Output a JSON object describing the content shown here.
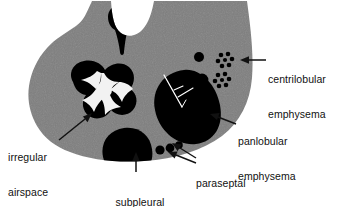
{
  "figure": {
    "type": "medical-illustration",
    "background_color": "#ffffff",
    "lung_fill_color": "#808080",
    "lesion_color": "#000000",
    "text_color": "#111111",
    "width": 344,
    "height": 207
  },
  "labels": {
    "centrilobular": {
      "name": "centrilobular-emphysema-label",
      "lines": [
        "centrilobular",
        "emphysema"
      ],
      "arrow": "points-left"
    },
    "panlobular": {
      "name": "panlobular-emphysema-label",
      "lines": [
        "panlobular",
        "emphysema"
      ],
      "arrow": "points-left"
    },
    "paraseptal": {
      "name": "paraseptal-emphysema-label",
      "lines": [
        "paraseptal",
        "emphysema"
      ],
      "arrow": "points-upper-left-double"
    },
    "subpleural": {
      "name": "subpleural-bulla-label",
      "lines": [
        "subpleural",
        "bulla"
      ],
      "arrow": "points-up"
    },
    "irregular": {
      "name": "irregular-airspace-enlargement-label",
      "lines": [
        "irregular",
        "airspace",
        "enlargement"
      ],
      "arrow": "points-upper-right"
    }
  },
  "features": {
    "apical_bulla": {
      "name": "apical-tadpole-bulla",
      "description": "teardrop lesion at apical notch"
    },
    "irregular_cluster": {
      "name": "irregular-airspace-cluster",
      "description": "ring of black blobs around white star-shaped septa"
    },
    "panlobular_mass": {
      "name": "panlobular-emphysema-mass",
      "description": "large black oval with white branching vessel"
    },
    "centrilobular_dots": {
      "name": "centrilobular-emphysema-foci",
      "solid_circle_count": 2,
      "rosette_count": 2,
      "dots_per_rosette": 7
    },
    "subpleural_bulla": {
      "name": "subpleural-bulla-dome",
      "description": "large black dome abutting the pleural surface"
    },
    "paraseptal_cysts": {
      "name": "paraseptal-emphysema-cysts",
      "count": 3,
      "description": "small round cysts in a row along the pleura"
    }
  }
}
